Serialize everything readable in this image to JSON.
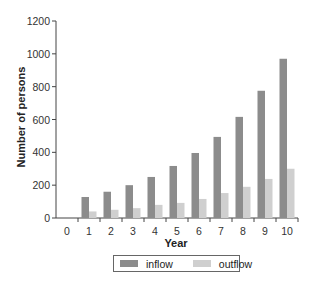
{
  "chart_data": {
    "type": "bar",
    "title": "",
    "xlabel": "Year",
    "ylabel": "Number of persons",
    "categories": [
      "0",
      "1",
      "2",
      "3",
      "4",
      "5",
      "6",
      "7",
      "8",
      "9",
      "10"
    ],
    "series": [
      {
        "name": "inflow",
        "color": "#8c8c8c",
        "values": [
          0,
          128,
          160,
          200,
          250,
          317,
          396,
          494,
          616,
          775,
          970
        ]
      },
      {
        "name": "outflow",
        "color": "#cfcfcf",
        "values": [
          0,
          40,
          50,
          60,
          80,
          92,
          116,
          152,
          190,
          238,
          300
        ]
      }
    ],
    "ylim": [
      0,
      1200
    ],
    "yticks": [
      0,
      200,
      400,
      600,
      800,
      1000,
      1200
    ],
    "grid": false,
    "legend_position": "bottom"
  },
  "legend": {
    "items": [
      {
        "label": "inflow",
        "color": "#8c8c8c"
      },
      {
        "label": "outflow",
        "color": "#cfcfcf"
      }
    ]
  }
}
